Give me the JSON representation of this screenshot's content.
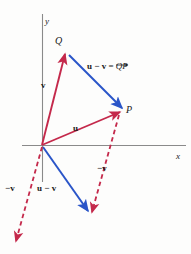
{
  "figure": {
    "kind": "vector-subtraction-diagram",
    "background_color": "#fdfdfc",
    "colors": {
      "red": "#c4294b",
      "blue": "#2a55c8",
      "axis": "#8a8a8a",
      "text": "#1a1a1a"
    },
    "axes": {
      "x_label": "x",
      "y_label": "y",
      "origin": {
        "x": 42,
        "y": 145
      },
      "x_axis": {
        "x1": 22,
        "y1": 145,
        "x2": 186,
        "y2": 145
      },
      "y_axis": {
        "x1": 42,
        "y1": 14,
        "x2": 42,
        "y2": 182
      }
    },
    "points": [
      {
        "name": "point-q",
        "label": "Q",
        "x": 65,
        "y": 53,
        "label_x": 55,
        "label_y": 36
      },
      {
        "name": "point-p",
        "label": "P",
        "x": 120,
        "y": 112,
        "label_x": 126,
        "label_y": 106
      }
    ],
    "vectors": [
      {
        "name": "vector-v",
        "label": "v",
        "style": "solid",
        "color": "#c4294b",
        "from": {
          "x": 42,
          "y": 145
        },
        "to": {
          "x": 65,
          "y": 53
        },
        "label_x": 42,
        "label_y": 86
      },
      {
        "name": "vector-u",
        "label": "u",
        "style": "solid",
        "color": "#c4294b",
        "from": {
          "x": 42,
          "y": 145
        },
        "to": {
          "x": 120,
          "y": 112
        },
        "label_x": 74,
        "label_y": 128
      },
      {
        "name": "vector-u-minus-v-qp",
        "label_parts": {
          "lead": "u − v = ",
          "arrow_over": "QP"
        },
        "style": "solid",
        "color": "#2a55c8",
        "from": {
          "x": 69,
          "y": 55
        },
        "to": {
          "x": 122,
          "y": 108
        },
        "label_x": 88,
        "label_y": 66
      },
      {
        "name": "vector-u-minus-v-origin",
        "label": "u − v",
        "style": "solid",
        "color": "#2a55c8",
        "from": {
          "x": 43,
          "y": 147
        },
        "to": {
          "x": 88,
          "y": 211
        },
        "label_x": 38,
        "label_y": 188
      },
      {
        "name": "vector-neg-v-origin",
        "label": "−v",
        "style": "dashed",
        "color": "#c4294b",
        "from": {
          "x": 42,
          "y": 147
        },
        "to": {
          "x": 16,
          "y": 241
        },
        "label_x": 7,
        "label_y": 188
      },
      {
        "name": "vector-neg-v-at-p",
        "label": "−v",
        "style": "dashed",
        "color": "#c4294b",
        "from": {
          "x": 119,
          "y": 115
        },
        "to": {
          "x": 92,
          "y": 212
        },
        "label_x": 98,
        "label_y": 167
      }
    ]
  }
}
